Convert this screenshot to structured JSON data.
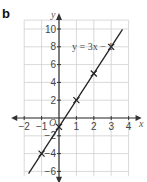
{
  "panel_label": "b",
  "chart_data": {
    "type": "line",
    "title": "",
    "xlabel": "x",
    "ylabel": "y",
    "xlim": [
      -2,
      4
    ],
    "ylim": [
      -6,
      10
    ],
    "grid": true,
    "origin_label": "O",
    "x_ticks": [
      -2,
      -1,
      1,
      2,
      3,
      4
    ],
    "y_ticks": [
      10,
      8,
      6,
      4,
      2,
      -2,
      -4,
      -6
    ],
    "x_tick_labels": [
      "−2",
      "−1",
      "1",
      "2",
      "3",
      "4"
    ],
    "y_tick_labels": [
      "10",
      "8",
      "6",
      "4",
      "2",
      "−2",
      "−4",
      "−6"
    ],
    "series": [
      {
        "name": "y = 3x − 1",
        "equation": "y = 3x − 1",
        "slope": 3,
        "intercept": -1,
        "marked_points": [
          {
            "x": -1,
            "y": -4
          },
          {
            "x": 0,
            "y": -1
          },
          {
            "x": 1,
            "y": 2
          },
          {
            "x": 2,
            "y": 5
          },
          {
            "x": 3,
            "y": 8
          }
        ],
        "marker": "cross",
        "color": "#222222"
      }
    ],
    "annotation": "y = 3x − 1"
  }
}
